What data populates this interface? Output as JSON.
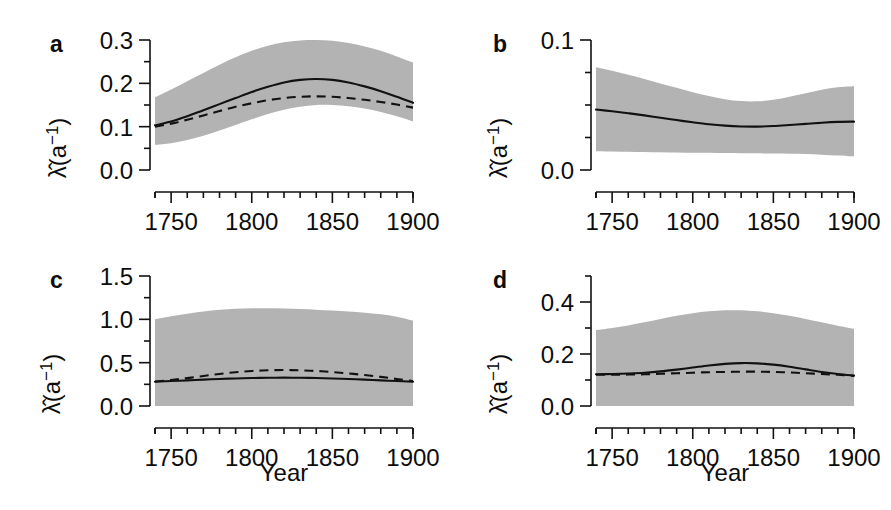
{
  "figure": {
    "background": "#ffffff",
    "band_color": "#b3b3b3",
    "line_color": "#111111",
    "xlabel": "Year",
    "ylabel_main": "λ̂(a",
    "ylabel_sup": "−1",
    "ylabel_close": ")"
  },
  "chart_data": [
    {
      "type": "line",
      "panel": "a",
      "title": "a",
      "xlabel": "Year",
      "ylabel": "λ̂(a−1)",
      "xlim": [
        1740,
        1900
      ],
      "ylim": [
        0.0,
        0.3
      ],
      "xticks": [
        1750,
        1800,
        1850,
        1900
      ],
      "xtick_labels": [
        "1750",
        "1800",
        "1850",
        "1900"
      ],
      "xminor_step": 10,
      "yticks": [
        0.0,
        0.1,
        0.2,
        0.3
      ],
      "ytick_labels": [
        "0.0",
        "0.1",
        "0.2",
        "0.3"
      ],
      "yminor": [
        0.05,
        0.15,
        0.25
      ],
      "grid": false,
      "legend": "none",
      "x": [
        1740,
        1750,
        1760,
        1770,
        1780,
        1790,
        1800,
        1810,
        1820,
        1830,
        1840,
        1850,
        1860,
        1870,
        1880,
        1890,
        1900
      ],
      "series": [
        {
          "name": "estimate-solid",
          "style": "solid",
          "values": [
            0.103,
            0.112,
            0.124,
            0.138,
            0.152,
            0.166,
            0.18,
            0.192,
            0.202,
            0.208,
            0.21,
            0.208,
            0.202,
            0.193,
            0.182,
            0.169,
            0.155
          ]
        },
        {
          "name": "estimate-dashed",
          "style": "dashed",
          "values": [
            0.1,
            0.107,
            0.116,
            0.126,
            0.136,
            0.146,
            0.154,
            0.161,
            0.166,
            0.169,
            0.17,
            0.169,
            0.166,
            0.162,
            0.157,
            0.151,
            0.144
          ]
        },
        {
          "name": "confidence-upper",
          "style": "band",
          "values": [
            0.168,
            0.186,
            0.205,
            0.224,
            0.243,
            0.26,
            0.275,
            0.287,
            0.295,
            0.299,
            0.3,
            0.298,
            0.293,
            0.285,
            0.275,
            0.262,
            0.248
          ]
        },
        {
          "name": "confidence-lower",
          "style": "band",
          "values": [
            0.058,
            0.062,
            0.069,
            0.079,
            0.091,
            0.104,
            0.117,
            0.129,
            0.139,
            0.146,
            0.15,
            0.15,
            0.147,
            0.142,
            0.134,
            0.124,
            0.112
          ]
        }
      ]
    },
    {
      "type": "line",
      "panel": "b",
      "title": "b",
      "xlabel": "Year",
      "ylabel": "λ̂(a−1)",
      "xlim": [
        1740,
        1900
      ],
      "ylim": [
        0.0,
        0.1
      ],
      "xticks": [
        1750,
        1800,
        1850,
        1900
      ],
      "xtick_labels": [
        "1750",
        "1800",
        "1850",
        "1900"
      ],
      "xminor_step": 10,
      "yticks": [
        0.0,
        0.1
      ],
      "ytick_labels": [
        "0.0",
        "0.1"
      ],
      "yminor": [
        0.025,
        0.05,
        0.075
      ],
      "grid": false,
      "legend": "none",
      "x": [
        1740,
        1750,
        1760,
        1770,
        1780,
        1790,
        1800,
        1810,
        1820,
        1830,
        1840,
        1850,
        1860,
        1870,
        1880,
        1890,
        1900
      ],
      "series": [
        {
          "name": "estimate-solid",
          "style": "solid",
          "values": [
            0.0465,
            0.0452,
            0.0437,
            0.042,
            0.0402,
            0.0384,
            0.0367,
            0.0352,
            0.0341,
            0.0335,
            0.0334,
            0.0338,
            0.0346,
            0.0355,
            0.0364,
            0.037,
            0.0372
          ]
        },
        {
          "name": "confidence-upper",
          "style": "band",
          "values": [
            0.079,
            0.0763,
            0.0733,
            0.07,
            0.0666,
            0.0632,
            0.0599,
            0.0569,
            0.0545,
            0.053,
            0.0528,
            0.054,
            0.0563,
            0.0591,
            0.0618,
            0.0637,
            0.0645
          ]
        },
        {
          "name": "confidence-lower",
          "style": "band",
          "values": [
            0.0145,
            0.0143,
            0.0141,
            0.0139,
            0.0137,
            0.0135,
            0.0133,
            0.0132,
            0.013,
            0.0129,
            0.0128,
            0.0127,
            0.0125,
            0.0123,
            0.0118,
            0.0112,
            0.0105
          ]
        }
      ]
    },
    {
      "type": "line",
      "panel": "c",
      "title": "c",
      "xlabel": "Year",
      "ylabel": "λ̂(a−1)",
      "xlim": [
        1740,
        1900
      ],
      "ylim": [
        0.0,
        1.5
      ],
      "xticks": [
        1750,
        1800,
        1850,
        1900
      ],
      "xtick_labels": [
        "1750",
        "1800",
        "1850",
        "1900"
      ],
      "xminor_step": 10,
      "yticks": [
        0.0,
        0.5,
        1.0,
        1.5
      ],
      "ytick_labels": [
        "0.0",
        "0.5",
        "1.0",
        "1.5"
      ],
      "yminor": [
        0.25,
        0.75,
        1.25
      ],
      "grid": false,
      "legend": "none",
      "x": [
        1740,
        1750,
        1760,
        1770,
        1780,
        1790,
        1800,
        1810,
        1820,
        1830,
        1840,
        1850,
        1860,
        1870,
        1880,
        1890,
        1900
      ],
      "series": [
        {
          "name": "estimate-solid",
          "style": "solid",
          "values": [
            0.28,
            0.288,
            0.296,
            0.304,
            0.312,
            0.318,
            0.323,
            0.326,
            0.327,
            0.326,
            0.323,
            0.318,
            0.312,
            0.304,
            0.296,
            0.288,
            0.28
          ]
        },
        {
          "name": "estimate-dashed",
          "style": "dashed",
          "values": [
            0.282,
            0.3,
            0.322,
            0.346,
            0.37,
            0.39,
            0.404,
            0.412,
            0.415,
            0.412,
            0.404,
            0.392,
            0.376,
            0.357,
            0.336,
            0.312,
            0.288
          ]
        },
        {
          "name": "confidence-upper",
          "style": "band",
          "values": [
            1.0,
            1.035,
            1.065,
            1.09,
            1.11,
            1.122,
            1.128,
            1.129,
            1.126,
            1.12,
            1.112,
            1.102,
            1.09,
            1.076,
            1.058,
            1.03,
            0.985
          ]
        },
        {
          "name": "confidence-lower",
          "style": "band",
          "values": [
            0.0,
            0.0,
            0.0,
            0.0,
            0.0,
            0.0,
            0.0,
            0.0,
            0.0,
            0.0,
            0.0,
            0.0,
            0.0,
            0.0,
            0.0,
            0.0,
            0.0
          ]
        }
      ]
    },
    {
      "type": "line",
      "panel": "d",
      "title": "d",
      "xlabel": "Year",
      "ylabel": "λ̂(a−1)",
      "xlim": [
        1740,
        1900
      ],
      "ylim": [
        0.0,
        0.5
      ],
      "xticks": [
        1750,
        1800,
        1850,
        1900
      ],
      "xtick_labels": [
        "1750",
        "1800",
        "1850",
        "1900"
      ],
      "xminor_step": 10,
      "yticks": [
        0.0,
        0.2,
        0.4
      ],
      "ytick_labels": [
        "0.0",
        "0.2",
        "0.4"
      ],
      "yminor": [
        0.1,
        0.3,
        0.5
      ],
      "grid": false,
      "legend": "none",
      "x": [
        1740,
        1750,
        1760,
        1770,
        1780,
        1790,
        1800,
        1810,
        1820,
        1830,
        1840,
        1850,
        1860,
        1870,
        1880,
        1890,
        1900
      ],
      "series": [
        {
          "name": "estimate-solid",
          "style": "solid",
          "values": [
            0.122,
            0.123,
            0.125,
            0.128,
            0.133,
            0.14,
            0.148,
            0.156,
            0.162,
            0.165,
            0.164,
            0.159,
            0.151,
            0.141,
            0.131,
            0.123,
            0.117
          ]
        },
        {
          "name": "estimate-dashed",
          "style": "dashed",
          "values": [
            0.12,
            0.12,
            0.121,
            0.122,
            0.124,
            0.126,
            0.128,
            0.13,
            0.131,
            0.132,
            0.132,
            0.131,
            0.129,
            0.126,
            0.123,
            0.12,
            0.116
          ]
        },
        {
          "name": "confidence-upper",
          "style": "band",
          "values": [
            0.292,
            0.3,
            0.31,
            0.322,
            0.335,
            0.347,
            0.357,
            0.364,
            0.368,
            0.368,
            0.364,
            0.357,
            0.347,
            0.335,
            0.322,
            0.309,
            0.297
          ]
        },
        {
          "name": "confidence-lower",
          "style": "band",
          "values": [
            0.0,
            0.0,
            0.0,
            0.0,
            0.0,
            0.0,
            0.0,
            0.0,
            0.0,
            0.0,
            0.0,
            0.0,
            0.0,
            0.0,
            0.0,
            0.0,
            0.0
          ]
        }
      ]
    }
  ]
}
